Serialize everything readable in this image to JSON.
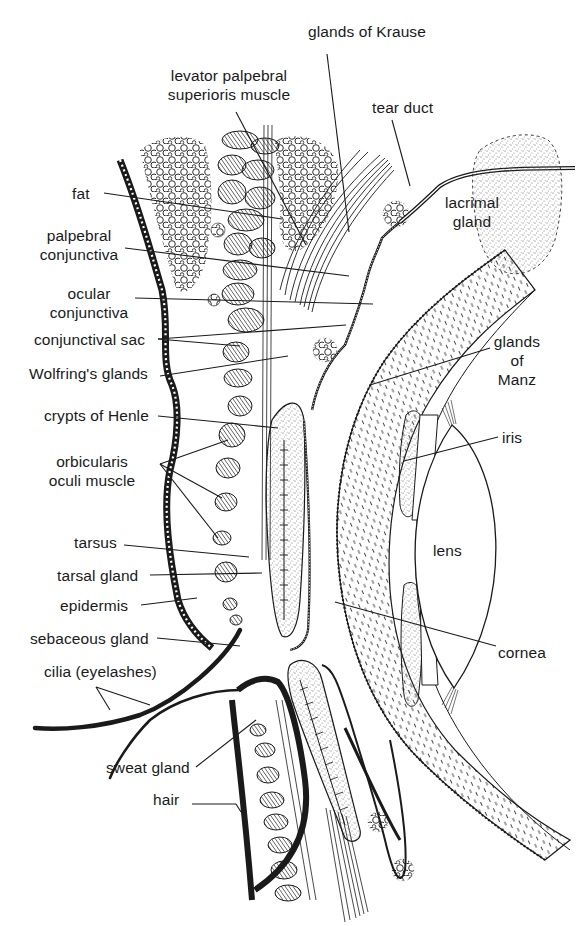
{
  "diagram": {
    "colors": {
      "ink": "#1a1a1a",
      "background": "#ffffff",
      "stipple": "#555555"
    },
    "labels": [
      {
        "id": "glands-of-krause",
        "text": "glands of Krause",
        "x": 308,
        "y": 22,
        "align": "l",
        "leaders": [
          [
            327,
            54,
            349,
            232
          ]
        ]
      },
      {
        "id": "levator-palpebral",
        "text": "levator palpebral\nsuperioris muscle",
        "x": 154,
        "y": 66,
        "align": "c",
        "w": 150,
        "leaders": [
          [
            236,
            112,
            306,
            245
          ]
        ]
      },
      {
        "id": "tear-duct",
        "text": "tear duct",
        "x": 372,
        "y": 98,
        "align": "l",
        "leaders": [
          [
            392,
            120,
            410,
            186
          ]
        ]
      },
      {
        "id": "lacrimal-gland",
        "text": "lacrimal\ngland",
        "x": 437,
        "y": 193,
        "align": "c",
        "w": 70,
        "leaders": []
      },
      {
        "id": "fat",
        "text": "fat",
        "x": 72,
        "y": 184,
        "align": "l",
        "leaders": [
          [
            104,
            193,
            282,
            219
          ]
        ]
      },
      {
        "id": "palpebral-conjunctiva",
        "text": "palpebral\nconjunctiva",
        "x": 36,
        "y": 226,
        "align": "c",
        "w": 86,
        "leaders": [
          [
            125,
            248,
            349,
            276
          ]
        ]
      },
      {
        "id": "ocular-conjunctiva",
        "text": "ocular\nconjunctiva",
        "x": 44,
        "y": 284,
        "align": "c",
        "w": 90,
        "leaders": [
          [
            135,
            298,
            373,
            304
          ]
        ]
      },
      {
        "id": "conjunctival-sac",
        "text": "conjunctival sac",
        "x": 34,
        "y": 330,
        "align": "l",
        "leaders": [
          [
            158,
            339,
            346,
            325
          ],
          [
            158,
            339,
            240,
            346
          ]
        ]
      },
      {
        "id": "wolfrings-glands",
        "text": "Wolfring's glands",
        "x": 29,
        "y": 364,
        "align": "l",
        "leaders": [
          [
            160,
            376,
            288,
            356
          ]
        ]
      },
      {
        "id": "crypts-of-henle",
        "text": "crypts of Henle",
        "x": 44,
        "y": 406,
        "align": "l",
        "leaders": [
          [
            158,
            416,
            278,
            428
          ]
        ]
      },
      {
        "id": "orbicularis",
        "text": "orbicularis\noculi muscle",
        "x": 44,
        "y": 452,
        "align": "c",
        "w": 96,
        "leaders": [
          [
            160,
            464,
            228,
            440
          ],
          [
            160,
            464,
            222,
            498
          ],
          [
            160,
            464,
            218,
            538
          ]
        ]
      },
      {
        "id": "tarsus",
        "text": "tarsus",
        "x": 74,
        "y": 533,
        "align": "l",
        "leaders": [
          [
            124,
            545,
            249,
            557
          ]
        ]
      },
      {
        "id": "tarsal-gland",
        "text": "tarsal gland",
        "x": 57,
        "y": 566,
        "align": "l",
        "leaders": [
          [
            150,
            575,
            262,
            573
          ]
        ]
      },
      {
        "id": "epidermis",
        "text": "epidermis",
        "x": 60,
        "y": 596,
        "align": "l",
        "leaders": [
          [
            141,
            605,
            197,
            598
          ]
        ]
      },
      {
        "id": "sebaceous-gland",
        "text": "sebaceous gland",
        "x": 30,
        "y": 629,
        "align": "l",
        "leaders": [
          [
            157,
            638,
            240,
            646
          ]
        ]
      },
      {
        "id": "cilia",
        "text": "cilia (eyelashes)",
        "x": 44,
        "y": 662,
        "align": "l",
        "leaders": [
          [
            96,
            687,
            110,
            710
          ],
          [
            96,
            687,
            150,
            705
          ]
        ]
      },
      {
        "id": "sweat-gland",
        "text": "sweat gland",
        "x": 106,
        "y": 758,
        "align": "l",
        "leaders": [
          [
            196,
            767,
            256,
            720
          ]
        ]
      },
      {
        "id": "hair",
        "text": "hair",
        "x": 153,
        "y": 790,
        "align": "l",
        "leaders": [
          [
            192,
            804,
            236,
            804
          ],
          [
            236,
            804,
            241,
            812
          ]
        ]
      },
      {
        "id": "glands-of-manz",
        "text": "glands\nof\nManz",
        "x": 481,
        "y": 332,
        "align": "c",
        "w": 72,
        "leaders": [
          [
            490,
            348,
            370,
            385
          ]
        ]
      },
      {
        "id": "iris",
        "text": "iris",
        "x": 502,
        "y": 428,
        "align": "l",
        "leaders": [
          [
            498,
            437,
            404,
            461
          ]
        ]
      },
      {
        "id": "lens",
        "text": "lens",
        "x": 433,
        "y": 541,
        "align": "l",
        "leaders": []
      },
      {
        "id": "cornea",
        "text": "cornea",
        "x": 498,
        "y": 643,
        "align": "l",
        "leaders": [
          [
            496,
            646,
            335,
            602
          ]
        ]
      }
    ]
  }
}
